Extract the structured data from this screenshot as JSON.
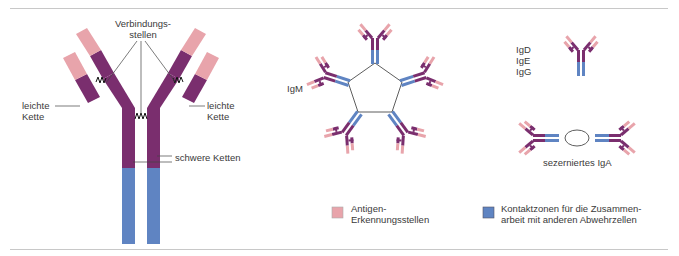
{
  "figure": {
    "colors": {
      "antigen": "#e8a4ab",
      "heavy": "#7a2e6e",
      "constant": "#5f84c2",
      "line": "#333333",
      "rule": "#c8c8c8"
    },
    "main_antibody": {
      "labels": {
        "binding_sites": "Verbindungs-\nstellen",
        "light_chain_left": "leichte\nKette",
        "light_chain_right": "leichte\nKette",
        "heavy_chains": "schwere Ketten"
      }
    },
    "igm": {
      "label": "IgM"
    },
    "monomer": {
      "label": "IgD\nIgE\nIgG"
    },
    "iga": {
      "label": "sezerniertes IgA"
    },
    "legend": [
      {
        "label": "Antigen-\nErkennungsstellen",
        "color": "#e8a4ab"
      },
      {
        "label": "Kontaktzonen für die Zusammen-\narbeit mit anderen Abwehrzellen",
        "color": "#5f84c2"
      }
    ]
  }
}
